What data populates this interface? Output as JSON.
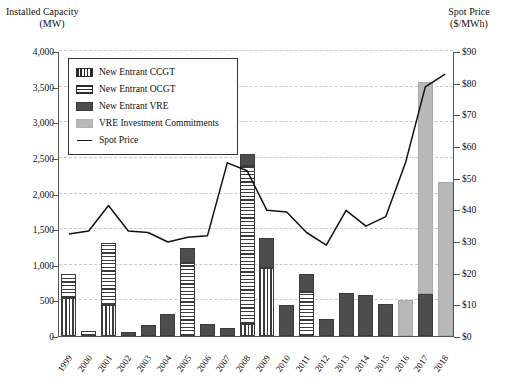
{
  "axes": {
    "left_title_line1": "Installed Capacity",
    "left_title_line2": "(MW)",
    "right_title_line1": "Spot Price",
    "right_title_line2": "($/MWh)"
  },
  "legend": {
    "items": [
      {
        "label": "New Entrant CCGT",
        "style": "ccgt"
      },
      {
        "label": "New Entrant OCGT",
        "style": "ocgt"
      },
      {
        "label": "New Entrant VRE",
        "style": "vre"
      },
      {
        "label": "VRE Investment Commitments",
        "style": "commit"
      },
      {
        "label": "Spot Price",
        "style": "line"
      }
    ]
  },
  "chart_data": {
    "type": "bar",
    "title": "",
    "xlabel": "",
    "ylabel": "Installed Capacity (MW)",
    "y2label": "Spot Price ($/MWh)",
    "ylim": [
      0,
      4000
    ],
    "y2lim": [
      0,
      90
    ],
    "grid": true,
    "legend_position": "top-left",
    "categories": [
      "1999",
      "2000",
      "2001",
      "2002",
      "2003",
      "2004",
      "2005",
      "2006",
      "2007",
      "2008",
      "2009",
      "2010",
      "2011",
      "2012",
      "2013",
      "2014",
      "2015",
      "2016",
      "2017",
      "2018"
    ],
    "ytick_labels": [
      "0",
      "500",
      "1,000",
      "1,500",
      "2,000",
      "2,500",
      "3,000",
      "3,500",
      "4,000"
    ],
    "ytick_values": [
      0,
      500,
      1000,
      1500,
      2000,
      2500,
      3000,
      3500,
      4000
    ],
    "y2tick_labels": [
      "$0",
      "$10",
      "$20",
      "$30",
      "$40",
      "$50",
      "$60",
      "$70",
      "$80",
      "$90"
    ],
    "y2tick_values": [
      0,
      10,
      20,
      30,
      40,
      50,
      60,
      70,
      80,
      90
    ],
    "stacked": true,
    "series": [
      {
        "name": "New Entrant CCGT",
        "style": "ccgt",
        "axis": "left",
        "values": [
          530,
          0,
          430,
          0,
          0,
          0,
          0,
          0,
          0,
          170,
          950,
          0,
          0,
          0,
          0,
          0,
          0,
          0,
          0,
          0
        ]
      },
      {
        "name": "New Entrant OCGT",
        "style": "ocgt",
        "axis": "left",
        "values": [
          340,
          70,
          880,
          0,
          0,
          0,
          1030,
          0,
          0,
          2210,
          0,
          0,
          620,
          0,
          0,
          0,
          0,
          0,
          0,
          0
        ]
      },
      {
        "name": "New Entrant VRE",
        "style": "vre",
        "axis": "left",
        "values": [
          0,
          0,
          0,
          60,
          160,
          310,
          200,
          175,
          115,
          180,
          420,
          440,
          250,
          240,
          610,
          570,
          450,
          0,
          590,
          0
        ]
      },
      {
        "name": "VRE Investment Commitments",
        "style": "commit",
        "axis": "left",
        "values": [
          0,
          0,
          0,
          0,
          0,
          0,
          0,
          0,
          0,
          0,
          0,
          0,
          0,
          0,
          0,
          0,
          0,
          500,
          2970,
          2160
        ]
      },
      {
        "name": "Spot Price",
        "style": "line",
        "axis": "right",
        "values": [
          32.5,
          33.5,
          41.5,
          33.5,
          33.0,
          30.0,
          31.5,
          32.0,
          55.0,
          52.5,
          40.0,
          39.5,
          33.0,
          29.0,
          40.0,
          35.0,
          38.0,
          55.0,
          79.0,
          83.0
        ]
      }
    ]
  }
}
